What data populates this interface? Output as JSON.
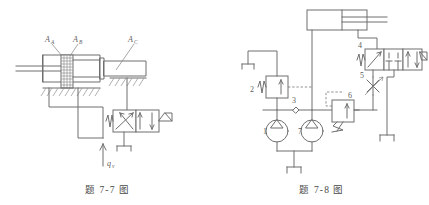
{
  "page": {
    "background_color": "#ffffff",
    "line_color": "#6f6f6f",
    "text_color": "#5e5e5e",
    "width": 429,
    "height": 205
  },
  "figures": [
    {
      "id": "figure-7-7",
      "caption": "题 7-7 图",
      "title": "差动液压缸回路",
      "type": "hydraulic-schematic",
      "labels": {
        "area_a": "A",
        "area_a_sub": "A",
        "area_b": "A",
        "area_b_sub": "B",
        "area_c": "A",
        "area_c_sub": "C",
        "flow": "q",
        "flow_sub": "v"
      },
      "components": [
        {
          "name": "differential-cylinder",
          "kind": "cylinder"
        },
        {
          "name": "piston-rod",
          "kind": "rod"
        },
        {
          "name": "piston-seal-pack",
          "kind": "hatched-piston"
        },
        {
          "name": "secondary-cylinder-chamber",
          "kind": "cylinder-chamber"
        },
        {
          "name": "directional-valve",
          "kind": "2-position-4-way-valve"
        },
        {
          "name": "valve-spring",
          "kind": "spring"
        },
        {
          "name": "valve-lever",
          "kind": "manual-lever"
        },
        {
          "name": "reservoir",
          "kind": "tank"
        },
        {
          "name": "supply-flow-arrow",
          "kind": "arrow"
        },
        {
          "name": "ground-hatching",
          "kind": "hatch"
        }
      ]
    },
    {
      "id": "figure-7-8",
      "caption": "题 7-8 图",
      "title": "双泵供油调速回路",
      "type": "hydraulic-schematic",
      "labels": {
        "pump_main": "1",
        "relief_valve": "2",
        "check_valve": "3",
        "directional_valve": "4",
        "throttle_valve": "5",
        "unloading_valve": "6",
        "pump_aux": "7"
      },
      "components": [
        {
          "name": "hydraulic-cylinder",
          "kind": "cylinder"
        },
        {
          "name": "pump-1",
          "kind": "pump",
          "label": "1"
        },
        {
          "name": "relief-valve-2",
          "kind": "relief-valve",
          "label": "2"
        },
        {
          "name": "check-valve-3",
          "kind": "check-valve",
          "label": "3"
        },
        {
          "name": "directional-valve-4",
          "kind": "3-position-4-way-valve",
          "label": "4"
        },
        {
          "name": "throttle-valve-5",
          "kind": "throttle-valve",
          "label": "5"
        },
        {
          "name": "unloading-valve-6",
          "kind": "sequence-valve",
          "label": "6"
        },
        {
          "name": "pump-7",
          "kind": "pump",
          "label": "7"
        },
        {
          "name": "reservoir-main",
          "kind": "tank"
        },
        {
          "name": "reservoir-relief",
          "kind": "tank"
        },
        {
          "name": "reservoir-directional",
          "kind": "tank"
        },
        {
          "name": "pilot-line",
          "kind": "dashed-pilot-line"
        }
      ]
    }
  ]
}
